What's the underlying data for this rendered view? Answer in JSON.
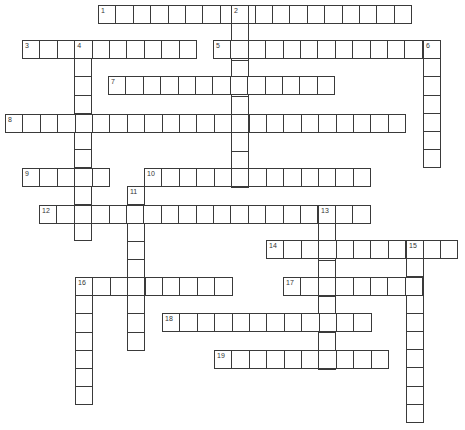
{
  "puzzle": {
    "type": "crossword",
    "cell_w": 17.4,
    "cell_h": 18.2,
    "border_color": "#3a3a3a",
    "words": [
      {
        "number": "1",
        "dir": "across",
        "x": 98,
        "y": 5,
        "length": 18
      },
      {
        "number": "2",
        "dir": "down",
        "x": 231,
        "y": 5,
        "length": 10
      },
      {
        "number": "3",
        "dir": "across",
        "x": 22,
        "y": 40,
        "length": 10
      },
      {
        "number": "4",
        "dir": "down",
        "x": 74,
        "y": 40,
        "length": 11
      },
      {
        "number": "5",
        "dir": "across",
        "x": 213,
        "y": 40,
        "length": 13
      },
      {
        "number": "6",
        "dir": "down",
        "x": 423,
        "y": 40,
        "length": 7
      },
      {
        "number": "7",
        "dir": "across",
        "x": 108,
        "y": 76,
        "length": 13
      },
      {
        "number": "8",
        "dir": "across",
        "x": 5,
        "y": 114,
        "length": 23
      },
      {
        "number": "9",
        "dir": "across",
        "x": 22,
        "y": 168,
        "length": 5
      },
      {
        "number": "10",
        "dir": "across",
        "x": 144,
        "y": 168,
        "length": 13
      },
      {
        "number": "11",
        "dir": "down",
        "x": 127,
        "y": 186,
        "length": 9
      },
      {
        "number": "12",
        "dir": "across",
        "x": 39,
        "y": 205,
        "length": 19
      },
      {
        "number": "13",
        "dir": "down",
        "x": 318,
        "y": 205,
        "length": 9
      },
      {
        "number": "14",
        "dir": "across",
        "x": 266,
        "y": 240,
        "length": 11
      },
      {
        "number": "15",
        "dir": "down",
        "x": 406,
        "y": 240,
        "length": 10
      },
      {
        "number": "16",
        "dir": "across",
        "x": 75,
        "y": 277,
        "length": 9
      },
      {
        "number": "16",
        "dir": "down",
        "x": 75,
        "y": 277,
        "length": 7
      },
      {
        "number": "17",
        "dir": "across",
        "x": 283,
        "y": 277,
        "length": 8
      },
      {
        "number": "18",
        "dir": "across",
        "x": 162,
        "y": 313,
        "length": 12
      },
      {
        "number": "19",
        "dir": "across",
        "x": 214,
        "y": 350,
        "length": 10
      }
    ]
  }
}
